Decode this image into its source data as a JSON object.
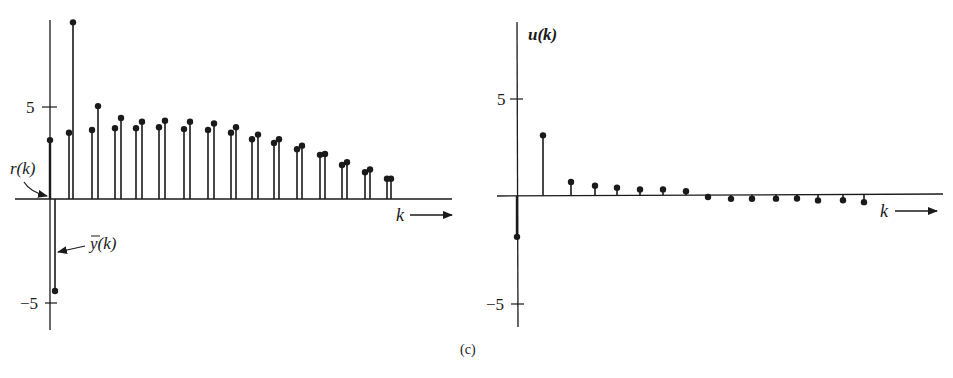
{
  "figure_label": "(c)",
  "chart_data": [
    {
      "type": "stem",
      "id": "left",
      "title": "",
      "xlabel": "k",
      "ylabel": "",
      "yticks": [
        5,
        -5
      ],
      "ytick_labels": [
        "5",
        "−5"
      ],
      "ylim": [
        -6.9,
        9.8
      ],
      "grid": false,
      "legend_position": "inline annotations",
      "annotations": [
        {
          "text": "r(k)",
          "points_to": "r at k=0"
        },
        {
          "text": "y̅(k)",
          "points_to": "y-bar at k=0"
        }
      ],
      "k": [
        0,
        1,
        2,
        3,
        4,
        5,
        6,
        7,
        8,
        9,
        10,
        11,
        12,
        13,
        14,
        15
      ],
      "series": [
        {
          "name": "r(k)",
          "values": [
            3.2,
            3.6,
            3.75,
            3.85,
            3.85,
            3.9,
            3.8,
            3.75,
            3.6,
            3.25,
            3.05,
            2.7,
            2.4,
            1.85,
            1.45,
            1.1
          ]
        },
        {
          "name": "y̅(k)",
          "values": [
            -5.0,
            9.6,
            5.05,
            4.4,
            4.2,
            4.25,
            4.2,
            4.1,
            3.9,
            3.5,
            3.25,
            2.9,
            2.45,
            2.0,
            1.6,
            1.1
          ]
        }
      ]
    },
    {
      "type": "stem",
      "id": "right",
      "title": "",
      "xlabel": "k",
      "ylabel": "u(k)",
      "yticks": [
        5,
        -5
      ],
      "ytick_labels": [
        "5",
        "−5"
      ],
      "ylim": [
        -6.6,
        9.0
      ],
      "grid": false,
      "k": [
        0,
        1,
        2,
        3,
        4,
        5,
        6,
        7,
        8,
        9,
        10,
        11,
        12,
        13,
        14,
        15
      ],
      "series": [
        {
          "name": "u(k)",
          "values": [
            -2.1,
            3.1,
            0.7,
            0.5,
            0.4,
            0.3,
            0.3,
            0.2,
            -0.1,
            -0.2,
            -0.2,
            -0.2,
            -0.2,
            -0.3,
            -0.3,
            -0.4
          ]
        }
      ]
    }
  ],
  "labels": {
    "left_tick_5": "5",
    "left_tick_m5": "−5",
    "left_r": "r(k)",
    "left_ybar": "y(k)",
    "left_k": "k",
    "right_u": "u(k)",
    "right_tick_5": "5",
    "right_tick_m5": "−5",
    "right_k": "k"
  }
}
